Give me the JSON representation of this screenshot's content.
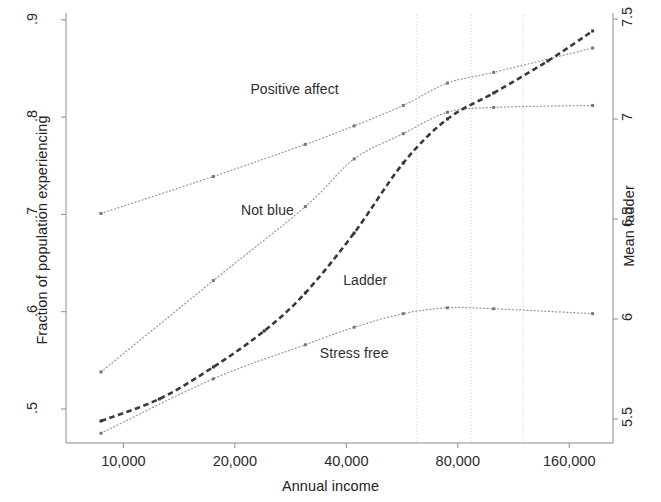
{
  "chart_data": {
    "type": "line",
    "title": "",
    "xlabel": "Annual income",
    "ylabel": "Fraction of population experiencing",
    "ylabel_right": "Mean ladder",
    "xscale": "log",
    "xlim": [
      7000,
      210000
    ],
    "ylim": [
      0.465,
      0.905
    ],
    "ylim_right": [
      5.38,
      7.52
    ],
    "grid": "vertical-only",
    "legend": "inline-annotations",
    "xticks": [
      10000,
      20000,
      40000,
      80000,
      160000
    ],
    "xtick_labels": [
      "10,000",
      "20,000",
      "40,000",
      "80,000",
      "160,000"
    ],
    "yticks_left": [
      0.5,
      0.6,
      0.7,
      0.8,
      0.9
    ],
    "ytick_labels_left": [
      ".5",
      ".6",
      ".7",
      ".8",
      ".9"
    ],
    "yticks_right": [
      5.5,
      6,
      6.5,
      7,
      7.5
    ],
    "ytick_labels_right": [
      "5.5",
      "6",
      "6.5",
      "7",
      "7.5"
    ],
    "gridlines_x": [
      62000,
      87000,
      120000
    ],
    "series": [
      {
        "name": "Positive affect",
        "axis": "left",
        "style": "dotted",
        "label_x": 29000,
        "label_y": 0.828,
        "x": [
          8700,
          17500,
          31000,
          42000,
          57000,
          75000,
          100000,
          185000
        ],
        "values": [
          0.701,
          0.739,
          0.772,
          0.791,
          0.812,
          0.835,
          0.846,
          0.871
        ]
      },
      {
        "name": "Not blue",
        "axis": "left",
        "style": "dotted",
        "label_x": 24500,
        "label_y": 0.703,
        "x": [
          8700,
          17500,
          31000,
          42000,
          57000,
          75000,
          100000,
          185000
        ],
        "values": [
          0.538,
          0.632,
          0.708,
          0.757,
          0.783,
          0.805,
          0.81,
          0.812
        ]
      },
      {
        "name": "Ladder",
        "axis": "right",
        "style": "dashed",
        "label_x": 45000,
        "label_y": 0.632,
        "x": [
          8700,
          12500,
          17500,
          24000,
          31000,
          42000,
          57000,
          75000,
          100000,
          140000,
          185000
        ],
        "values": [
          5.49,
          5.6,
          5.76,
          5.94,
          6.13,
          6.43,
          6.78,
          7.0,
          7.13,
          7.29,
          7.44
        ]
      },
      {
        "name": "Stress free",
        "axis": "left",
        "style": "dotted",
        "label_x": 42000,
        "label_y": 0.556,
        "x": [
          8700,
          17500,
          31000,
          42000,
          57000,
          75000,
          100000,
          185000
        ],
        "values": [
          0.475,
          0.531,
          0.566,
          0.584,
          0.598,
          0.604,
          0.603,
          0.598
        ]
      }
    ],
    "colors": {
      "ladder": "#3a3a3a",
      "dotted_series": "#9a9a9a",
      "axis": "#8c8c8c",
      "gridline": "#c8c8c8",
      "text": "#2b2b2b",
      "background": "#ffffff"
    }
  },
  "geometry": {
    "plot_left": 66,
    "plot_right": 613,
    "plot_top": 15,
    "plot_bottom": 443
  }
}
